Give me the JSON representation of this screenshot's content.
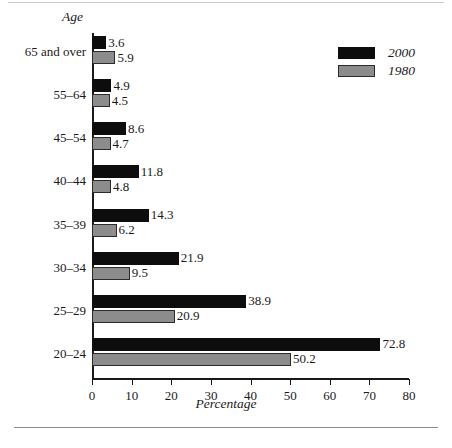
{
  "figure": {
    "age_axis_title": "Age",
    "x_axis_title": "Percentage"
  },
  "legend": {
    "position": "top-right",
    "entries": [
      {
        "label": "2000",
        "color": "#0d0d0d"
      },
      {
        "label": "1980",
        "color": "#8c8c8c"
      }
    ]
  },
  "chart_data": {
    "type": "bar",
    "orientation": "horizontal",
    "title": "",
    "xlabel": "Percentage",
    "ylabel": "Age",
    "xlim": [
      0,
      80
    ],
    "xticks": [
      0,
      10,
      20,
      30,
      40,
      50,
      60,
      70,
      80
    ],
    "grid": false,
    "legend_position": "top-right",
    "categories": [
      "65 and over",
      "55–64",
      "45–54",
      "40–44",
      "35–39",
      "30–34",
      "25–29",
      "20–24"
    ],
    "series": [
      {
        "name": "2000",
        "color": "#0d0d0d",
        "values": [
          3.6,
          4.9,
          8.6,
          11.8,
          14.3,
          21.9,
          38.9,
          72.8
        ]
      },
      {
        "name": "1980",
        "color": "#8c8c8c",
        "values": [
          5.9,
          4.5,
          4.7,
          4.8,
          6.2,
          9.5,
          20.9,
          50.2
        ]
      }
    ],
    "value_labels": {
      "2000": [
        "3.6",
        "4.9",
        "8.6",
        "11.8",
        "14.3",
        "21.9",
        "38.9",
        "72.8"
      ],
      "1980": [
        "5.9",
        "4.5",
        "4.7",
        "4.8",
        "6.2",
        "9.5",
        "20.9",
        "50.2"
      ]
    }
  }
}
